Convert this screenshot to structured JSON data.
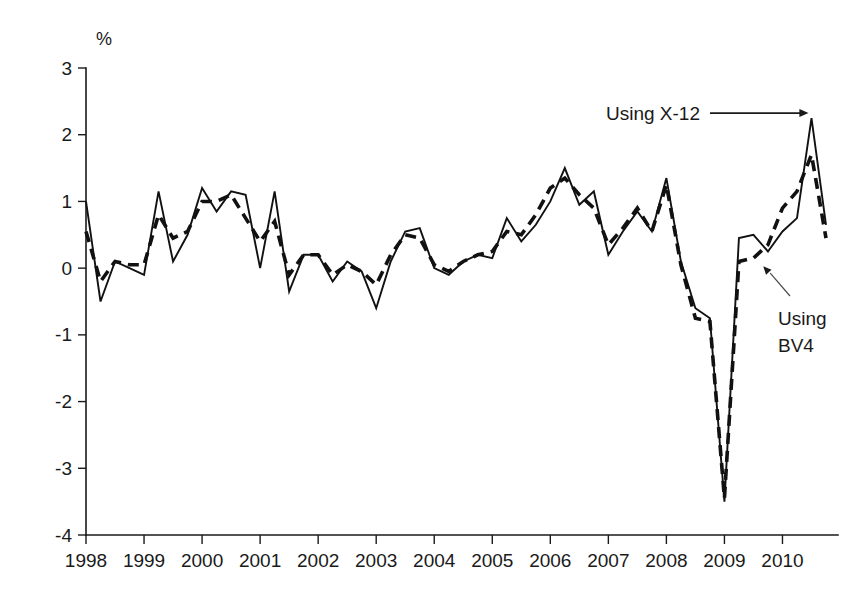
{
  "chart_data": {
    "type": "line",
    "title": "",
    "subtitle": "",
    "xlabel": "",
    "ylabel": "",
    "unit_label": "%",
    "grid": false,
    "legend_position": "none",
    "xlim": [
      1998.0,
      2010.75
    ],
    "ylim": [
      -4,
      3
    ],
    "y_ticks": [
      3,
      2,
      1,
      0,
      -1,
      -2,
      -3,
      -4
    ],
    "y_tick_labels": [
      "3",
      "2",
      "1",
      "0",
      "-1",
      "-2",
      "-3",
      "-4"
    ],
    "x_ticks": [
      1998,
      1999,
      2000,
      2001,
      2002,
      2003,
      2004,
      2005,
      2006,
      2007,
      2008,
      2009,
      2010
    ],
    "x_tick_labels": [
      "1998",
      "1999",
      "2000",
      "2001",
      "2002",
      "2003",
      "2004",
      "2005",
      "2006",
      "2007",
      "2008",
      "2009",
      "2010"
    ],
    "x": [
      1998.0,
      1998.25,
      1998.5,
      1998.75,
      1999.0,
      1999.25,
      1999.5,
      1999.75,
      2000.0,
      2000.25,
      2000.5,
      2000.75,
      2001.0,
      2001.25,
      2001.5,
      2001.75,
      2002.0,
      2002.25,
      2002.5,
      2002.75,
      2003.0,
      2003.25,
      2003.5,
      2003.75,
      2004.0,
      2004.25,
      2004.5,
      2004.75,
      2005.0,
      2005.25,
      2005.5,
      2005.75,
      2006.0,
      2006.25,
      2006.5,
      2006.75,
      2007.0,
      2007.25,
      2007.5,
      2007.75,
      2008.0,
      2008.25,
      2008.5,
      2008.75,
      2009.0,
      2009.25,
      2009.5,
      2009.75,
      2010.0,
      2010.25,
      2010.5,
      2010.75
    ],
    "series": [
      {
        "name": "Using X-12",
        "style": "solid",
        "values": [
          1.0,
          -0.5,
          0.1,
          0.0,
          -0.1,
          1.15,
          0.1,
          0.5,
          1.2,
          0.85,
          1.15,
          1.1,
          0.0,
          1.15,
          -0.35,
          0.2,
          0.2,
          -0.2,
          0.1,
          -0.05,
          -0.6,
          0.1,
          0.55,
          0.6,
          0.0,
          -0.1,
          0.1,
          0.2,
          0.15,
          0.75,
          0.4,
          0.65,
          1.0,
          1.5,
          0.95,
          1.15,
          0.2,
          0.55,
          0.85,
          0.55,
          1.35,
          0.1,
          -0.6,
          -0.75,
          -3.5,
          0.45,
          0.5,
          0.25,
          0.55,
          0.75,
          2.25,
          0.65
        ]
      },
      {
        "name": "Using BV4",
        "style": "dashed",
        "values": [
          0.55,
          -0.2,
          0.1,
          0.05,
          0.05,
          0.8,
          0.45,
          0.55,
          1.0,
          1.0,
          1.1,
          0.75,
          0.4,
          0.7,
          -0.1,
          0.2,
          0.2,
          -0.1,
          0.05,
          -0.05,
          -0.25,
          0.2,
          0.5,
          0.45,
          0.05,
          -0.05,
          0.1,
          0.2,
          0.25,
          0.55,
          0.5,
          0.8,
          1.2,
          1.35,
          1.1,
          0.9,
          0.35,
          0.6,
          0.9,
          0.55,
          1.25,
          0.05,
          -0.75,
          -0.8,
          -3.45,
          0.1,
          0.15,
          0.35,
          0.9,
          1.15,
          1.7,
          0.45
        ]
      }
    ],
    "annotations": [
      {
        "text": "Using X-12",
        "text_line_1": "Using X-12",
        "text_line_2": "",
        "points_to_x": 2010.5,
        "points_to_y": 2.25,
        "arrow": true
      },
      {
        "text": "Using BV4",
        "text_line_1": "Using",
        "text_line_2": "BV4",
        "points_to_x": 2009.6,
        "points_to_y": 0.12,
        "arrow": true
      }
    ],
    "colors": {
      "axis": "#1a1a1a",
      "series_x12": "#111111",
      "series_bv4": "#111111",
      "background": "#ffffff"
    }
  }
}
